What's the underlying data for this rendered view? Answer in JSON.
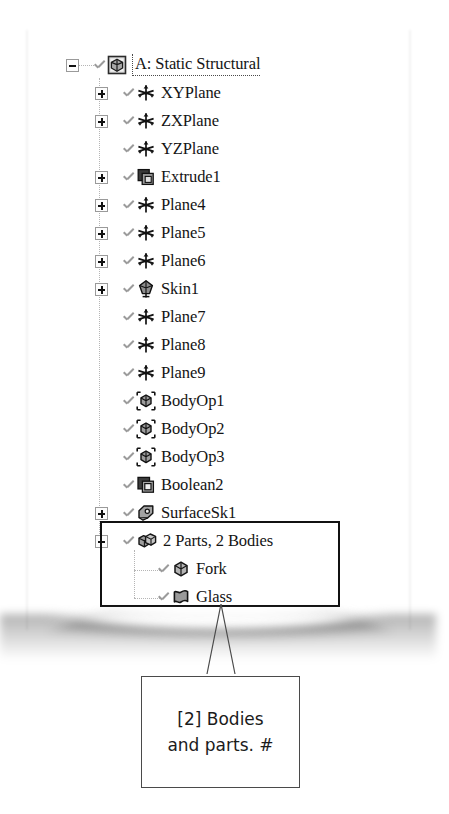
{
  "document": {
    "type": "scanned-screenshot-figure",
    "background_color": "#ffffff"
  },
  "tree": {
    "name": "geometry-outline-tree",
    "rows": [
      {
        "label": "A: Static Structural",
        "icon": "geometry-project-icon",
        "indent": 0,
        "expander": "minus",
        "checked": true,
        "is_root": true
      },
      {
        "label": "XYPlane",
        "icon": "plane-icon",
        "indent": 1,
        "expander": "plus",
        "checked": true
      },
      {
        "label": "ZXPlane",
        "icon": "plane-icon",
        "indent": 1,
        "expander": "plus",
        "checked": true
      },
      {
        "label": "YZPlane",
        "icon": "plane-icon",
        "indent": 1,
        "expander": "none",
        "checked": true
      },
      {
        "label": "Extrude1",
        "icon": "extrude-icon",
        "indent": 1,
        "expander": "plus",
        "checked": true
      },
      {
        "label": "Plane4",
        "icon": "plane-icon",
        "indent": 1,
        "expander": "plus",
        "checked": true
      },
      {
        "label": "Plane5",
        "icon": "plane-icon",
        "indent": 1,
        "expander": "plus",
        "checked": true
      },
      {
        "label": "Plane6",
        "icon": "plane-icon",
        "indent": 1,
        "expander": "plus",
        "checked": true
      },
      {
        "label": "Skin1",
        "icon": "skin-loft-icon",
        "indent": 1,
        "expander": "plus",
        "checked": true
      },
      {
        "label": "Plane7",
        "icon": "plane-icon",
        "indent": 1,
        "expander": "none",
        "checked": true
      },
      {
        "label": "Plane8",
        "icon": "plane-icon",
        "indent": 1,
        "expander": "none",
        "checked": true
      },
      {
        "label": "Plane9",
        "icon": "plane-icon",
        "indent": 1,
        "expander": "none",
        "checked": true
      },
      {
        "label": "BodyOp1",
        "icon": "body-operation-icon",
        "indent": 1,
        "expander": "none",
        "checked": true
      },
      {
        "label": "BodyOp2",
        "icon": "body-operation-icon",
        "indent": 1,
        "expander": "none",
        "checked": true
      },
      {
        "label": "BodyOp3",
        "icon": "body-operation-icon",
        "indent": 1,
        "expander": "none",
        "checked": true
      },
      {
        "label": "Boolean2",
        "icon": "boolean-icon",
        "indent": 1,
        "expander": "none",
        "checked": true
      },
      {
        "label": "SurfaceSk1",
        "icon": "surface-sketch-icon",
        "indent": 1,
        "expander": "plus",
        "checked": true
      },
      {
        "label": "2 Parts, 2 Bodies",
        "icon": "parts-bodies-icon",
        "indent": 1,
        "expander": "minus",
        "checked": true,
        "highlighted": true
      },
      {
        "label": "Fork",
        "icon": "solid-body-icon",
        "indent": 2,
        "expander": "none",
        "checked": true,
        "highlighted": true
      },
      {
        "label": "Glass",
        "icon": "surface-body-icon",
        "indent": 2,
        "expander": "none",
        "checked": true,
        "highlighted": true
      }
    ]
  },
  "highlight": {
    "name": "bodies-and-parts-highlight",
    "border_color": "#111111"
  },
  "callout": {
    "name": "annotation-callout",
    "line1": "[2] Bodies",
    "line2": "and parts. #",
    "border_color": "#4a4a4a",
    "text_color": "#1b1b1b"
  }
}
